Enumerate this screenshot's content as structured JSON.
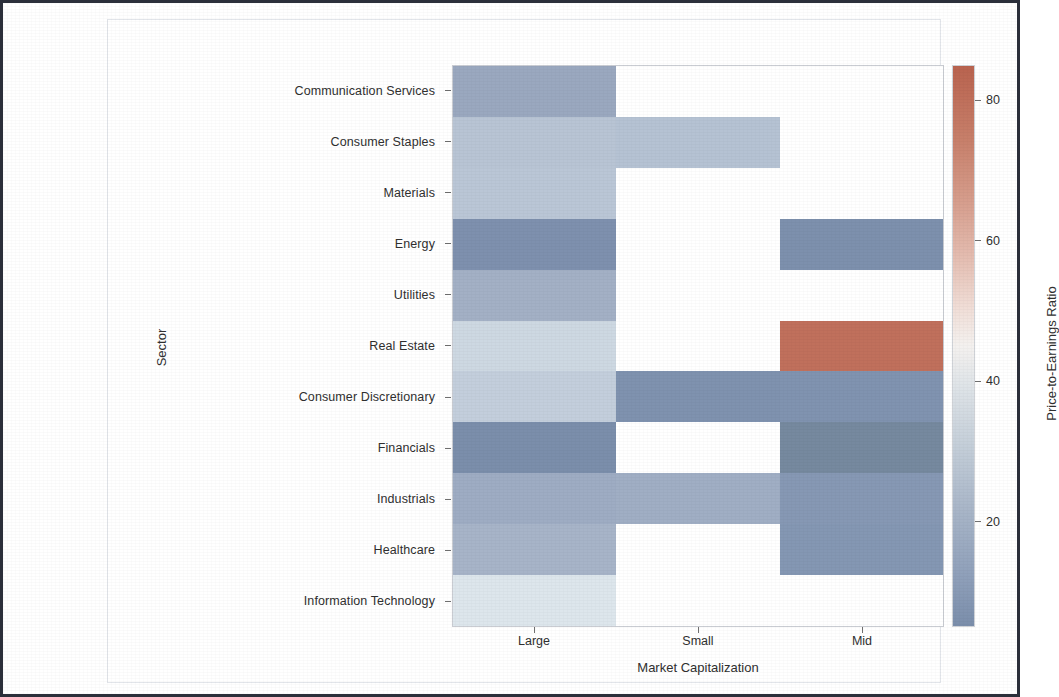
{
  "figure": {
    "y_axis_title": "Sector",
    "x_axis_title": "Market Capitalization",
    "colorbar_title": "Price-to-Earnings Ratio"
  },
  "chart_data": {
    "type": "heatmap",
    "title": "",
    "xlabel": "Market Capitalization",
    "ylabel": "Sector",
    "colorbar_label": "Price-to-Earnings Ratio",
    "colormap": "coolwarm",
    "grid": false,
    "legend_position": "right",
    "x_categories": [
      "Large",
      "Small",
      "Mid"
    ],
    "y_categories": [
      "Communication Services",
      "Consumer Staples",
      "Materials",
      "Energy",
      "Utilities",
      "Real Estate",
      "Consumer Discretionary",
      "Financials",
      "Industrials",
      "Healthcare",
      "Information Technology"
    ],
    "colorbar_ticks": [
      20,
      40,
      60,
      80
    ],
    "value_range": [
      5,
      85
    ],
    "missing_color": "#ffffff",
    "values": [
      [
        20.0,
        null,
        null
      ],
      [
        28.0,
        28.5,
        null
      ],
      [
        29.0,
        null,
        null
      ],
      [
        12.0,
        null,
        12.0
      ],
      [
        22.0,
        null,
        null
      ],
      [
        35.0,
        null,
        82.0
      ],
      [
        16.0,
        14.0,
        15.0
      ],
      [
        11.0,
        null,
        11.0
      ],
      [
        25.0,
        25.5,
        25.0
      ],
      [
        25.0,
        null,
        24.0
      ],
      [
        38.0,
        null,
        null
      ]
    ],
    "cell_colors": [
      [
        "#9aa8bf",
        null,
        null
      ],
      [
        "#b8c4d4",
        "#b5c2d3",
        null
      ],
      [
        "#bac6d6",
        null,
        null
      ],
      [
        "#7e90ae",
        null,
        "#7d90ad"
      ],
      [
        "#a3b0c5",
        null,
        null
      ],
      [
        "#cdd8e2",
        null,
        "#c0705c"
      ],
      [
        "#c3cedc",
        "#7f92af",
        "#8093b0"
      ],
      [
        "#7b8eab",
        null,
        "#76899f"
      ],
      [
        "#9eacc3",
        "#a0aec4",
        "#8698b4"
      ],
      [
        "#a7b4c8",
        null,
        "#8497b3"
      ],
      [
        "#dde6ec",
        null,
        null
      ]
    ]
  }
}
